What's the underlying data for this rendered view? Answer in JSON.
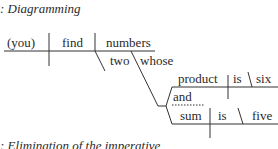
{
  "headings": {
    "top": ":  Diagramming",
    "bottom": ":  Elimination of the imperative"
  },
  "diagram": {
    "subject": "(you)",
    "verb": "find",
    "object": "numbers",
    "modifiers": [
      "two",
      "whose"
    ],
    "clause1": {
      "subject": "product",
      "verb": "is",
      "complement": "six"
    },
    "conjunction": "and",
    "clause2": {
      "subject": "sum",
      "verb": "is",
      "complement": "five"
    }
  },
  "colors": {
    "ink": "#2a2a2a",
    "background": "#ffffff"
  }
}
